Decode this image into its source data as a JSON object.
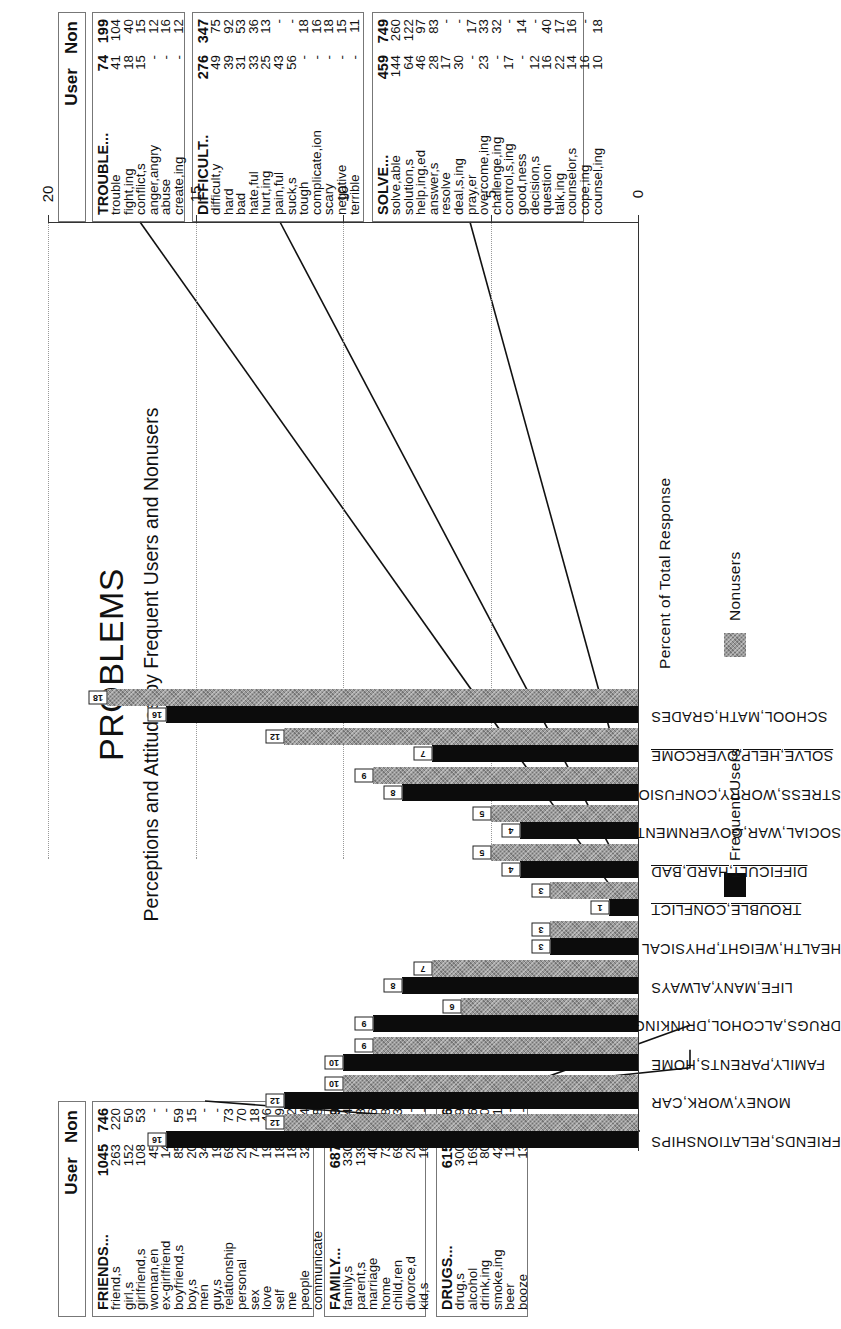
{
  "title": "PROBLEMS",
  "subtitle": "Perceptions and Attitudes by Frequent Users and Nonusers",
  "column_headers": {
    "user": "User",
    "non": "Non"
  },
  "legend": {
    "frequent_users": "Frequent Users",
    "nonusers": "Nonusers"
  },
  "colors": {
    "frequent_users": "#0c0c0c",
    "nonusers": "#9a9a9a"
  },
  "chart_data": {
    "type": "bar",
    "orientation": "vertical bars, page rotated 90deg counter-clockwise",
    "title": "PROBLEMS",
    "subtitle": "Perceptions and Attitudes by Frequent Users and Nonusers",
    "xlabel": "",
    "ylabel": "Percent of Total Response",
    "ylim": [
      0,
      20
    ],
    "yticks": [
      0,
      5,
      10,
      15,
      20
    ],
    "grid": true,
    "legend_position": "bottom",
    "categories": [
      "FRIENDS,RELATIONSHIPS",
      "MONEY,WORK,CAR",
      "FAMILY,PARENTS,HOME",
      "DRUGS,ALCOHOL,DRINKING",
      "LIFE,MANY,ALWAYS",
      "HEALTH,WEIGHT,PHYSICAL",
      "TROUBLE,CONFLICT",
      "DIFFICULT,HARD,BAD",
      "SOCIAL,WAR,GOVERNMENT",
      "STRESS,WORRY,CONFUSION",
      "SOLVE,HELP,OVERCOME",
      "SCHOOL,MATH,GRADES"
    ],
    "series": [
      {
        "name": "Frequent Users",
        "values": [
          16,
          12,
          10,
          9,
          8,
          3,
          1,
          4,
          4,
          8,
          7,
          16
        ]
      },
      {
        "name": "Nonusers",
        "values": [
          12,
          10,
          9,
          6,
          7,
          3,
          3,
          5,
          5,
          9,
          12,
          18
        ]
      }
    ]
  },
  "categories_underlined": [
    6,
    7,
    10
  ],
  "tables": {
    "friends": {
      "header": {
        "word": "FRIENDS...",
        "user": "1045",
        "non": "746"
      },
      "rows": [
        {
          "word": "friend,s",
          "user": "263",
          "non": "220"
        },
        {
          "word": "girl,s",
          "user": "152",
          "non": "50"
        },
        {
          "word": "girlfriend,s",
          "user": "108",
          "non": "53"
        },
        {
          "word": "woman,en",
          "user": "45",
          "non": "-"
        },
        {
          "word": "ex-girlfriend",
          "user": "14",
          "non": "-"
        },
        {
          "word": "boyfriend,s",
          "user": "85",
          "non": "59"
        },
        {
          "word": "boy,s",
          "user": "20",
          "non": "15"
        },
        {
          "word": "men",
          "user": "34",
          "non": "-"
        },
        {
          "word": "guy,s",
          "user": "19",
          "non": "-"
        },
        {
          "word": "relationship",
          "user": "69",
          "non": "73"
        },
        {
          "word": "personal",
          "user": "20",
          "non": "70"
        },
        {
          "word": "sex",
          "user": "74",
          "non": "18"
        },
        {
          "word": "love",
          "user": "19",
          "non": "46"
        },
        {
          "word": "self",
          "user": "18",
          "non": "9"
        },
        {
          "word": "me",
          "user": "18",
          "non": "22"
        },
        {
          "word": "people",
          "user": "32",
          "non": "64"
        },
        {
          "word": "communicate",
          "user": "-",
          "non": "18"
        },
        {
          "word": "fraternity,s",
          "user": "11",
          "non": "-"
        },
        {
          "word": "party,s",
          "user": "12",
          "non": "-"
        },
        {
          "word": "roommate,s",
          "user": "32",
          "non": "29"
        }
      ]
    },
    "family": {
      "header": {
        "word": "FAMILY...",
        "user": "687",
        "non": "579"
      },
      "rows": [
        {
          "word": "family,s",
          "user": "330",
          "non": "334"
        },
        {
          "word": "parent,s",
          "user": "139",
          "non": "68"
        },
        {
          "word": "marriage",
          "user": "40",
          "non": "46"
        },
        {
          "word": "home",
          "user": "73",
          "non": "88"
        },
        {
          "word": "child,ren",
          "user": "69",
          "non": "43"
        },
        {
          "word": "divorce,d",
          "user": "20",
          "non": "-"
        },
        {
          "word": "kid,s",
          "user": "16",
          "non": "-"
        }
      ]
    },
    "drugs": {
      "header": {
        "word": "DRUGS...",
        "user": "615",
        "non": "416"
      },
      "rows": [
        {
          "word": "drug,s",
          "user": "300",
          "non": "249"
        },
        {
          "word": "alcohol",
          "user": "169",
          "non": "116"
        },
        {
          "word": "drink,ing",
          "user": "80",
          "non": "30"
        },
        {
          "word": "smoke,ing",
          "user": "42",
          "non": "21"
        },
        {
          "word": "beer",
          "user": "11",
          "non": "-"
        },
        {
          "word": "booze",
          "user": "13",
          "non": "-"
        }
      ]
    },
    "trouble": {
      "header": {
        "word": "TROUBLE...",
        "user": "74",
        "non": "199"
      },
      "rows": [
        {
          "word": "trouble",
          "user": "41",
          "non": "104"
        },
        {
          "word": "fight,ing",
          "user": "18",
          "non": "40"
        },
        {
          "word": "conflict,s",
          "user": "15",
          "non": "15"
        },
        {
          "word": "anger,angry",
          "user": "-",
          "non": "12"
        },
        {
          "word": "abuse",
          "user": "-",
          "non": "16"
        },
        {
          "word": "create,ing",
          "user": "-",
          "non": "12"
        }
      ]
    },
    "difficult": {
      "header": {
        "word": "DIFFICULT..",
        "user": "276",
        "non": "347"
      },
      "rows": [
        {
          "word": "difficult,y",
          "user": "49",
          "non": "75"
        },
        {
          "word": "hard",
          "user": "39",
          "non": "92"
        },
        {
          "word": "bad",
          "user": "31",
          "non": "53"
        },
        {
          "word": "hate,ful",
          "user": "33",
          "non": "36"
        },
        {
          "word": "hurt,ing",
          "user": "25",
          "non": "13"
        },
        {
          "word": "pain,ful",
          "user": "43",
          "non": "-"
        },
        {
          "word": "suck,s",
          "user": "56",
          "non": "-"
        },
        {
          "word": "tough",
          "user": "-",
          "non": "18"
        },
        {
          "word": "complicate,ion",
          "user": "-",
          "non": "16"
        },
        {
          "word": "scary",
          "user": "-",
          "non": "18"
        },
        {
          "word": "negative",
          "user": "-",
          "non": "15"
        },
        {
          "word": "terrible",
          "user": "-",
          "non": "11"
        }
      ]
    },
    "solve": {
      "header": {
        "word": "SOLVE...",
        "user": "459",
        "non": "749"
      },
      "rows": [
        {
          "word": "solve,able",
          "user": "144",
          "non": "260"
        },
        {
          "word": "solution,s",
          "user": "64",
          "non": "122"
        },
        {
          "word": "help,ing,ed",
          "user": "46",
          "non": "97"
        },
        {
          "word": "answer,s",
          "user": "28",
          "non": "83"
        },
        {
          "word": "resolve",
          "user": "17",
          "non": "-"
        },
        {
          "word": "deal,s,ing",
          "user": "30",
          "non": "-"
        },
        {
          "word": "pray,er",
          "user": "-",
          "non": "17"
        },
        {
          "word": "overcome,ing",
          "user": "23",
          "non": "33"
        },
        {
          "word": "challenge,ing",
          "user": "-",
          "non": "32"
        },
        {
          "word": "control,s,ing",
          "user": "17",
          "non": "-"
        },
        {
          "word": "good,ness",
          "user": "-",
          "non": "14"
        },
        {
          "word": "decision,s",
          "user": "12",
          "non": "-"
        },
        {
          "word": "question",
          "user": "16",
          "non": "40"
        },
        {
          "word": "talk,ing",
          "user": "22",
          "non": "17"
        },
        {
          "word": "counselor,s",
          "user": "14",
          "non": "16"
        },
        {
          "word": "cope,ing",
          "user": "16",
          "non": "-"
        },
        {
          "word": "counsel,ing",
          "user": "10",
          "non": "18"
        }
      ]
    }
  }
}
